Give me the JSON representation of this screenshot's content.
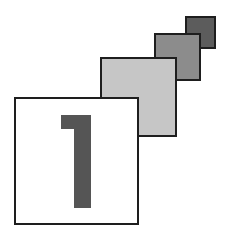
{
  "graphic": {
    "title": "Step 1 icon",
    "main_square": {
      "label": "1",
      "fill": "#ffffff",
      "digit_color": "#555555"
    },
    "squares": [
      {
        "name": "light",
        "fill": "#c6c6c6"
      },
      {
        "name": "medium",
        "fill": "#8c8c8c"
      },
      {
        "name": "dark",
        "fill": "#5c5c5c"
      }
    ],
    "border_color": "#1e1e1e"
  }
}
